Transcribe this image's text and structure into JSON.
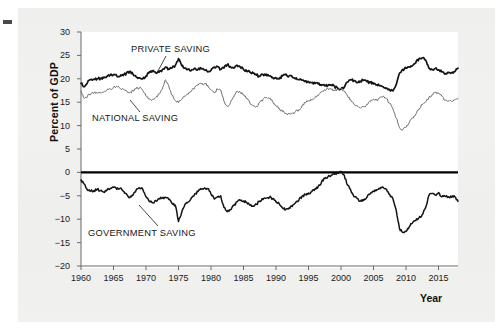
{
  "figure": {
    "background_color": "#f0f0ef",
    "canvas_color": "#ffffff",
    "ylabel": "Percent of GDP",
    "xlabel": "Year"
  },
  "chart_data": {
    "type": "line",
    "title": "",
    "subtitle": "",
    "xlabel": "Year",
    "ylabel": "Percent of GDP",
    "xlim": [
      1960,
      2018
    ],
    "ylim": [
      -20,
      30
    ],
    "xticks": [
      1960,
      1965,
      1970,
      1975,
      1980,
      1985,
      1990,
      1995,
      2000,
      2005,
      2010,
      2015
    ],
    "xtick_labels": [
      "1960",
      "1965",
      "1970",
      "1975",
      "1980",
      "1985",
      "1990",
      "1995",
      "2000",
      "2005",
      "2010",
      "2015"
    ],
    "yticks": [
      30,
      25,
      20,
      15,
      10,
      5,
      0,
      -5,
      -10,
      -15,
      -20
    ],
    "ytick_labels": [
      "30",
      "25",
      "20",
      "15",
      "10",
      "5",
      "0",
      "−5",
      "−10",
      "−15",
      "−20"
    ],
    "grid": false,
    "legend": "inline-annotations",
    "zero_line": 0,
    "annotations": [
      {
        "text": "PRIVATE SAVING",
        "series": "Private saving",
        "x": 1972.5,
        "y": 27.0
      },
      {
        "text": "NATIONAL SAVING",
        "series": "National saving",
        "x": 1966.0,
        "y": 12.5
      },
      {
        "text": "GOVERNMENT SAVING",
        "series": "Government saving",
        "x": 1965.0,
        "y": -12.5
      }
    ],
    "x": [
      1960.0,
      1960.5,
      1961.0,
      1961.5,
      1962.0,
      1962.5,
      1963.0,
      1963.5,
      1964.0,
      1964.5,
      1965.0,
      1965.5,
      1966.0,
      1966.5,
      1967.0,
      1967.5,
      1968.0,
      1968.5,
      1969.0,
      1969.5,
      1970.0,
      1970.5,
      1971.0,
      1971.5,
      1972.0,
      1972.5,
      1973.0,
      1973.5,
      1974.0,
      1974.5,
      1975.0,
      1975.5,
      1976.0,
      1976.5,
      1977.0,
      1977.5,
      1978.0,
      1978.5,
      1979.0,
      1979.5,
      1980.0,
      1980.5,
      1981.0,
      1981.5,
      1982.0,
      1982.5,
      1983.0,
      1983.5,
      1984.0,
      1984.5,
      1985.0,
      1985.5,
      1986.0,
      1986.5,
      1987.0,
      1987.5,
      1988.0,
      1988.5,
      1989.0,
      1989.5,
      1990.0,
      1990.5,
      1991.0,
      1991.5,
      1992.0,
      1992.5,
      1993.0,
      1993.5,
      1994.0,
      1994.5,
      1995.0,
      1995.5,
      1996.0,
      1996.5,
      1997.0,
      1997.5,
      1998.0,
      1998.5,
      1999.0,
      1999.5,
      2000.0,
      2000.5,
      2001.0,
      2001.5,
      2002.0,
      2002.5,
      2003.0,
      2003.5,
      2004.0,
      2004.5,
      2005.0,
      2005.5,
      2006.0,
      2006.5,
      2007.0,
      2007.5,
      2008.0,
      2008.5,
      2009.0,
      2009.5,
      2010.0,
      2010.5,
      2011.0,
      2011.5,
      2012.0,
      2012.5,
      2013.0,
      2013.5,
      2014.0,
      2014.5,
      2015.0,
      2015.5,
      2016.0,
      2016.5,
      2017.0,
      2017.5,
      2018.0
    ],
    "series": [
      {
        "name": "Private saving",
        "color": "#141414",
        "linewidth": 1.7,
        "values": [
          19.0,
          18.3,
          19.2,
          19.8,
          19.9,
          20.0,
          20.1,
          20.2,
          20.5,
          20.8,
          20.9,
          20.6,
          20.5,
          20.7,
          21.2,
          21.6,
          21.0,
          20.4,
          20.2,
          20.0,
          20.6,
          21.5,
          21.7,
          21.3,
          21.4,
          21.9,
          22.5,
          22.1,
          22.3,
          22.8,
          24.3,
          22.8,
          22.3,
          22.1,
          21.9,
          22.3,
          22.0,
          22.2,
          21.9,
          21.5,
          21.8,
          22.5,
          22.6,
          22.0,
          22.3,
          23.0,
          22.6,
          22.3,
          22.9,
          22.5,
          22.0,
          21.6,
          21.4,
          21.2,
          20.8,
          20.5,
          20.9,
          21.0,
          20.6,
          20.3,
          20.2,
          20.0,
          20.6,
          21.0,
          20.6,
          20.4,
          20.0,
          19.8,
          19.7,
          19.5,
          19.4,
          19.2,
          19.0,
          18.9,
          18.6,
          18.5,
          18.6,
          18.7,
          18.4,
          18.0,
          17.8,
          18.2,
          19.3,
          19.8,
          19.6,
          19.2,
          19.5,
          19.7,
          19.4,
          19.2,
          18.9,
          18.7,
          18.5,
          18.3,
          18.0,
          17.6,
          17.4,
          18.8,
          21.2,
          22.0,
          22.3,
          22.5,
          22.8,
          23.4,
          24.3,
          24.5,
          24.0,
          22.3,
          22.0,
          22.2,
          21.9,
          21.5,
          21.0,
          21.4,
          21.3,
          21.5,
          22.3
        ]
      },
      {
        "name": "National saving",
        "color": "#6f6f6f",
        "linewidth": 1.0,
        "values": [
          17.4,
          15.8,
          16.3,
          16.8,
          17.0,
          16.9,
          17.0,
          17.2,
          17.6,
          17.8,
          18.2,
          18.4,
          18.0,
          17.8,
          17.5,
          17.0,
          17.5,
          17.9,
          18.1,
          17.5,
          16.3,
          15.7,
          15.6,
          16.0,
          16.8,
          17.8,
          19.8,
          18.5,
          16.5,
          15.4,
          14.9,
          15.6,
          16.2,
          16.7,
          17.4,
          18.2,
          18.6,
          18.9,
          19.0,
          18.6,
          17.7,
          17.0,
          17.8,
          17.6,
          15.2,
          14.1,
          14.9,
          16.1,
          17.4,
          17.1,
          16.7,
          15.8,
          14.8,
          14.3,
          14.1,
          15.0,
          15.6,
          16.0,
          15.8,
          15.1,
          14.3,
          13.7,
          13.0,
          12.6,
          12.5,
          12.6,
          13.0,
          13.4,
          14.2,
          14.9,
          15.3,
          15.5,
          16.0,
          16.4,
          17.2,
          17.7,
          17.9,
          17.7,
          17.5,
          17.6,
          18.0,
          17.4,
          16.3,
          15.5,
          14.5,
          14.2,
          13.7,
          14.0,
          14.6,
          15.1,
          15.6,
          15.4,
          16.0,
          16.3,
          15.8,
          14.8,
          13.5,
          11.6,
          9.6,
          9.1,
          9.6,
          10.6,
          11.6,
          12.4,
          13.6,
          14.5,
          15.1,
          15.9,
          16.6,
          17.1,
          17.0,
          16.3,
          15.4,
          15.3,
          15.2,
          15.5,
          15.8
        ]
      },
      {
        "name": "Government saving",
        "color": "#141414",
        "linewidth": 1.5,
        "values": [
          -1.6,
          -2.5,
          -3.8,
          -4.0,
          -3.9,
          -3.6,
          -3.9,
          -4.2,
          -3.8,
          -3.4,
          -3.2,
          -3.6,
          -3.4,
          -4.0,
          -4.6,
          -5.4,
          -4.9,
          -3.7,
          -3.3,
          -3.6,
          -5.2,
          -6.2,
          -6.5,
          -6.0,
          -5.6,
          -5.5,
          -5.3,
          -5.8,
          -6.6,
          -7.0,
          -10.5,
          -8.5,
          -6.8,
          -6.3,
          -5.4,
          -4.6,
          -4.1,
          -3.6,
          -3.3,
          -3.5,
          -4.6,
          -5.7,
          -5.2,
          -5.0,
          -7.5,
          -8.4,
          -8.0,
          -7.1,
          -6.3,
          -6.0,
          -6.1,
          -6.4,
          -7.0,
          -7.2,
          -6.8,
          -6.1,
          -5.8,
          -5.5,
          -5.3,
          -5.6,
          -6.3,
          -6.7,
          -7.6,
          -7.9,
          -7.6,
          -7.3,
          -6.5,
          -6.0,
          -5.1,
          -4.7,
          -4.4,
          -4.1,
          -3.5,
          -3.0,
          -2.1,
          -1.3,
          -0.9,
          -0.6,
          -0.4,
          -0.2,
          0.2,
          -0.6,
          -2.7,
          -3.8,
          -5.2,
          -5.6,
          -6.1,
          -6.0,
          -5.3,
          -4.6,
          -4.0,
          -3.7,
          -3.5,
          -3.2,
          -3.6,
          -4.7,
          -5.7,
          -8.1,
          -12.0,
          -12.8,
          -12.6,
          -11.6,
          -10.8,
          -10.3,
          -9.7,
          -9.0,
          -7.6,
          -5.0,
          -4.5,
          -4.8,
          -4.3,
          -5.2,
          -5.1,
          -5.2,
          -5.3,
          -5.2,
          -6.2
        ]
      }
    ]
  },
  "axis": {
    "y_ticks": [
      "30",
      "25",
      "20",
      "15",
      "10",
      "5",
      "0",
      "−5",
      "−10",
      "−15",
      "−20"
    ],
    "x_ticks": [
      "1960",
      "1965",
      "1970",
      "1975",
      "1980",
      "1985",
      "1990",
      "1995",
      "2000",
      "2005",
      "2010",
      "2015"
    ]
  },
  "annotations": {
    "private": "PRIVATE SAVING",
    "national": "NATIONAL SAVING",
    "government": "GOVERNMENT SAVING"
  }
}
